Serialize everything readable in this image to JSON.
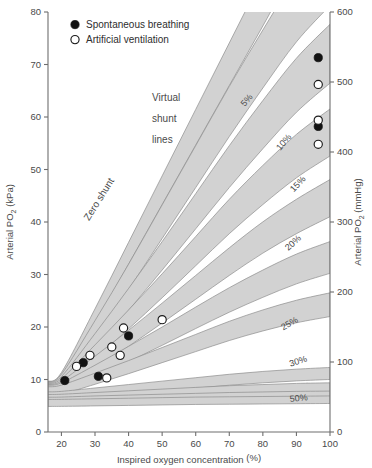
{
  "chart_data": {
    "type": "line",
    "title": "",
    "xlabel": "Inspired oxygen concentration (%)",
    "ylabel": "Arterial PO2 (kPa)",
    "ylabel_right": "Arterial PO2 (mmHg)",
    "xlim": [
      16,
      100
    ],
    "ylim": [
      0,
      80
    ],
    "ylim_right": [
      0,
      600
    ],
    "xticks": [
      20,
      30,
      40,
      50,
      60,
      70,
      80,
      90,
      100
    ],
    "yticks": [
      0,
      10,
      20,
      30,
      40,
      50,
      60,
      70,
      80
    ],
    "yticks_right": [
      0,
      100,
      200,
      300,
      400,
      500,
      600
    ],
    "grid": false,
    "legend_position": "top-left",
    "annotations": [
      {
        "text": "Virtual",
        "x": 47,
        "y": 63
      },
      {
        "text": "shunt",
        "x": 47,
        "y": 59
      },
      {
        "text": "lines",
        "x": 47,
        "y": 55
      },
      {
        "text": "Zero shunt",
        "x": 32,
        "y": 44,
        "rotated": true
      }
    ],
    "series": [
      {
        "name": "Zero shunt",
        "shunt_percent": 0,
        "label": "",
        "values_kpa": [
          10.5,
          22,
          34,
          46,
          58,
          70,
          82,
          94,
          103
        ]
      },
      {
        "name": "5% shunt",
        "shunt_percent": 5,
        "label": "5%",
        "values_kpa": [
          10.0,
          19.5,
          29.5,
          40,
          50.5,
          61,
          71,
          80.5,
          88
        ]
      },
      {
        "name": "10% shunt",
        "shunt_percent": 10,
        "label": "10%",
        "values_kpa": [
          9.6,
          17.2,
          25.2,
          33.5,
          42,
          50.5,
          58.5,
          66,
          72
        ]
      },
      {
        "name": "15% shunt",
        "shunt_percent": 15,
        "label": "15%",
        "values_kpa": [
          9.2,
          15.2,
          21.4,
          27.8,
          34.4,
          41,
          47,
          52.5,
          57
        ]
      },
      {
        "name": "20% shunt",
        "shunt_percent": 20,
        "label": "20%",
        "values_kpa": [
          8.8,
          13.2,
          17.8,
          22.6,
          27.5,
          32.4,
          37,
          41,
          44.5
        ]
      },
      {
        "name": "25% shunt",
        "shunt_percent": 25,
        "label": "25%",
        "values_kpa": [
          8.4,
          11.5,
          14.8,
          18.2,
          21.7,
          25.1,
          28.2,
          31,
          33.2
        ]
      },
      {
        "name": "30% shunt",
        "shunt_percent": 30,
        "label": "30%",
        "values_kpa": [
          8.0,
          10.1,
          12.3,
          14.6,
          16.9,
          19.2,
          21.2,
          22.9,
          24.2
        ]
      },
      {
        "name": "50% shunt",
        "shunt_percent": 50,
        "label": "50%",
        "values_kpa": [
          6.9,
          7.5,
          8.1,
          8.7,
          9.3,
          9.9,
          10.4,
          10.8,
          11.1
        ]
      },
      {
        "name": "60% shunt",
        "shunt_percent": 60,
        "label": "",
        "values_kpa": [
          6.4,
          6.7,
          7.0,
          7.3,
          7.6,
          7.9,
          8.1,
          8.3,
          8.4
        ]
      },
      {
        "name": "70% shunt",
        "shunt_percent": 70,
        "label": "",
        "values_kpa": [
          5.9,
          6.1,
          6.25,
          6.4,
          6.55,
          6.7,
          6.8,
          6.9,
          6.95
        ]
      },
      {
        "name": "80% shunt",
        "shunt_percent": 80,
        "label": "",
        "values_kpa": [
          5.5,
          5.6,
          5.7,
          5.8,
          5.9,
          5.95,
          6.0,
          6.05,
          6.1
        ]
      }
    ],
    "scatter": [
      {
        "group": "Spontaneous breathing",
        "marker": "filled",
        "points": [
          {
            "x": 21,
            "y": 9.8
          },
          {
            "x": 26.5,
            "y": 13.2
          },
          {
            "x": 31,
            "y": 10.6
          },
          {
            "x": 40,
            "y": 18.3
          },
          {
            "x": 96.5,
            "y": 71.3
          },
          {
            "x": 96.5,
            "y": 58.2
          }
        ]
      },
      {
        "group": "Artificial ventilation",
        "marker": "open",
        "points": [
          {
            "x": 24.5,
            "y": 12.5
          },
          {
            "x": 28.5,
            "y": 14.6
          },
          {
            "x": 33.5,
            "y": 10.3
          },
          {
            "x": 35,
            "y": 16.2
          },
          {
            "x": 37.5,
            "y": 14.6
          },
          {
            "x": 38.5,
            "y": 19.8
          },
          {
            "x": 50,
            "y": 21.4
          },
          {
            "x": 96.5,
            "y": 66.2
          },
          {
            "x": 96.5,
            "y": 59.4
          },
          {
            "x": 96.5,
            "y": 54.8
          }
        ]
      }
    ]
  },
  "legend": {
    "items": [
      {
        "label": "Spontaneous breathing",
        "marker": "filled"
      },
      {
        "label": "Artificial ventilation",
        "marker": "open"
      }
    ]
  },
  "colors": {
    "band_fill": "#d2d2d2",
    "band_stroke": "#8c8c8c",
    "axis": "#6e6e6e",
    "text": "#4a4a4a",
    "marker": "#121212"
  }
}
